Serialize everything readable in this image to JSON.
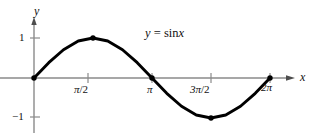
{
  "figure": {
    "kind": "cartesian-plot",
    "background_color": "#ffffff",
    "axis_color": "#8a8a8a",
    "curve_color": "#000000",
    "point_color": "#000000"
  },
  "axes": {
    "x_label": "x",
    "y_label": "y",
    "x_arrow": true,
    "y_arrow": true
  },
  "labels": {
    "equation": {
      "lhs": "y",
      "equals": "=",
      "fn": "sin",
      "arg": "x",
      "full": "y = sin x"
    },
    "y_ticks": [
      {
        "value": 1,
        "text": "1"
      },
      {
        "value": -1,
        "text": "−1"
      }
    ],
    "x_ticks": [
      {
        "value": 1.5708,
        "text": "π/2",
        "pi_part": "π",
        "rest": "/2"
      },
      {
        "value": 3.1416,
        "text": "π",
        "pi_part": "π",
        "rest": ""
      },
      {
        "value": 4.7124,
        "text": "3π/2",
        "pi_part": "3π",
        "rest": "/2"
      },
      {
        "value": 6.2832,
        "text": "2π",
        "pi_part": "2π",
        "rest": ""
      }
    ]
  },
  "chart_data": {
    "type": "line",
    "xlabel": "x",
    "ylabel": "y",
    "grid": false,
    "legend": "none",
    "xlim": [
      0,
      6.2832
    ],
    "ylim": [
      -1,
      1
    ],
    "xtick_values": [
      1.5708,
      3.1416,
      4.7124,
      6.2832
    ],
    "xtick_labels": [
      "π/2",
      "π",
      "3π/2",
      "2π"
    ],
    "ytick_values": [
      1,
      -1
    ],
    "ytick_labels": [
      "1",
      "−1"
    ],
    "series": [
      {
        "name": "y = sin x",
        "x": [
          0,
          0.3927,
          0.7854,
          1.1781,
          1.5708,
          1.9635,
          2.3562,
          2.7489,
          3.1416,
          3.5343,
          3.927,
          4.3197,
          4.7124,
          5.1051,
          5.4978,
          5.8905,
          6.2832
        ],
        "values": [
          0,
          0.3827,
          0.7071,
          0.9239,
          1,
          0.9239,
          0.7071,
          0.3827,
          0,
          -0.3827,
          -0.7071,
          -0.9239,
          -1,
          -0.9239,
          -0.7071,
          -0.3827,
          0
        ]
      }
    ],
    "marked_points": [
      {
        "x": 0,
        "y": 0,
        "label": ""
      },
      {
        "x": 1.5708,
        "y": 1,
        "label": "π/2"
      },
      {
        "x": 3.1416,
        "y": 0,
        "label": "π"
      },
      {
        "x": 4.7124,
        "y": -1,
        "label": "3π/2"
      },
      {
        "x": 6.2832,
        "y": 0,
        "label": "2π"
      }
    ]
  }
}
